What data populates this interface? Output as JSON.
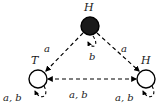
{
  "figure": {
    "type": "state-transition-diagram",
    "background_color": "#ffffff",
    "stroke_color": "#000000",
    "accent_fill_color": "#1a1a1a"
  },
  "nodes": [
    {
      "id": "top",
      "label": "H",
      "fill": "filled",
      "cx": 90,
      "cy": 26,
      "r": 9,
      "label_dx": -3,
      "label_dy": -24
    },
    {
      "id": "bottom-left",
      "label": "T",
      "fill": "open",
      "cx": 38,
      "cy": 79,
      "r": 9,
      "label_dx": -4,
      "label_dy": -25
    },
    {
      "id": "bottom-right",
      "label": "H",
      "fill": "open",
      "cx": 146,
      "cy": 79,
      "r": 9,
      "label_dx": -3,
      "label_dy": -25
    }
  ],
  "edges": [
    {
      "id": "top-to-bottom-left",
      "from": "top",
      "to": "bottom-left",
      "style": "dashed",
      "direction": "one-way",
      "label": "a"
    },
    {
      "id": "top-to-bottom-right",
      "from": "top",
      "to": "bottom-right",
      "style": "dashed",
      "direction": "one-way",
      "label": "a"
    },
    {
      "id": "bottom-left-right-bidirectional",
      "from": "bottom-left",
      "to": "bottom-right",
      "style": "dashed",
      "direction": "bidirectional",
      "label": "a, b"
    },
    {
      "id": "top-self-loop",
      "from": "top",
      "to": "top",
      "style": "dashed",
      "direction": "self-loop",
      "label": "b"
    },
    {
      "id": "bottom-left-self-loop",
      "from": "bottom-left",
      "to": "bottom-left",
      "style": "dashed",
      "direction": "self-loop",
      "label": "a, b"
    },
    {
      "id": "bottom-right-self-loop",
      "from": "bottom-right",
      "to": "bottom-right",
      "style": "dashed",
      "direction": "self-loop",
      "label": "a, b"
    }
  ],
  "labels": {
    "top_node": "H",
    "left_node": "T",
    "right_node": "H",
    "left_diagonal_edge": "a",
    "right_diagonal_edge": "a",
    "bottom_edge": "a, b",
    "top_self_loop": "b",
    "left_self_loop": "a, b",
    "right_self_loop": "a, b"
  }
}
